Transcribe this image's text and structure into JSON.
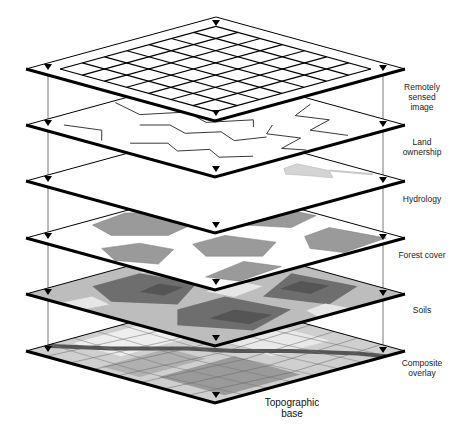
{
  "layers": [
    {
      "id": "remotely-sensed",
      "label_lines": [
        "Remotely",
        "sensed",
        "image"
      ],
      "fill": "#ffffff",
      "content": "grid",
      "grid_size": 7
    },
    {
      "id": "land-ownership",
      "label_lines": [
        "Land",
        "ownership"
      ],
      "fill": "#ffffff",
      "content": "parcels"
    },
    {
      "id": "hydrology",
      "label_lines": [
        "Hydrology"
      ],
      "fill": "#ffffff",
      "content": "water"
    },
    {
      "id": "forest-cover",
      "label_lines": [
        "Forest cover"
      ],
      "fill": "#ffffff",
      "content": "forest"
    },
    {
      "id": "soils",
      "label_lines": [
        "Soils"
      ],
      "fill": "#bdbdbd",
      "content": "soils"
    },
    {
      "id": "composite-overlay",
      "label_lines": [
        "Composite",
        "overlay"
      ],
      "fill": "#cfcfcf",
      "content": "composite"
    }
  ],
  "base_label_lines": [
    "Topographic",
    "base"
  ],
  "colors": {
    "outline": "#000000",
    "registration_line": "#555555",
    "light_gray": "#d4d4d4",
    "mid_gray": "#9a9a9a",
    "dark_gray": "#6e6e6e",
    "darker_gray": "#555555"
  },
  "geometry": {
    "center_x": 216,
    "left_x": 26,
    "right_x": 405,
    "layer_top_y": [
      17,
      73,
      129,
      186,
      242,
      299
    ],
    "half_height": 52
  }
}
